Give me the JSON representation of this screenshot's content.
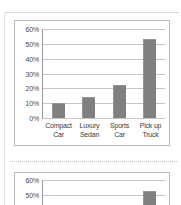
{
  "document": {
    "separator_label": "dotted-rule"
  },
  "chart_data": [
    {
      "id": "primary",
      "type": "bar",
      "title": "",
      "xlabel": "",
      "ylabel": "",
      "categories": [
        "Compact Car",
        "Luxury Sedan",
        "Sports Car",
        "Pick up Truck"
      ],
      "category_lines": [
        [
          "Compact",
          "Car"
        ],
        [
          "Luxury",
          "Sedan"
        ],
        [
          "Sports",
          "Car"
        ],
        [
          "Pick up",
          "Truck"
        ]
      ],
      "values": [
        10,
        14,
        22,
        53
      ],
      "ylim": [
        0,
        60
      ],
      "yticks": [
        0,
        10,
        20,
        30,
        40,
        50,
        60
      ],
      "ytick_labels": [
        "0%",
        "10%",
        "20%",
        "30%",
        "40%",
        "50%",
        "60%"
      ],
      "grid": true,
      "legend": false,
      "bar_color": "#808080",
      "grid_color": "#c6c6c6",
      "axis_color": "#9a9a9a"
    },
    {
      "id": "secondary",
      "type": "bar",
      "title": "",
      "xlabel": "",
      "ylabel": "",
      "categories": [
        "Compact Car",
        "Luxury Sedan",
        "Sports Car",
        "Pick up Truck"
      ],
      "values": [
        10,
        14,
        22,
        53
      ],
      "ylim": [
        0,
        60
      ],
      "yticks": [
        50,
        60
      ],
      "ytick_labels": [
        "50%",
        "60%"
      ],
      "grid": true,
      "legend": false,
      "bar_color": "#808080",
      "grid_color": "#c6c6c6",
      "axis_color": "#9a9a9a",
      "note": "partially visible, cropped at bottom of screenshot"
    }
  ]
}
